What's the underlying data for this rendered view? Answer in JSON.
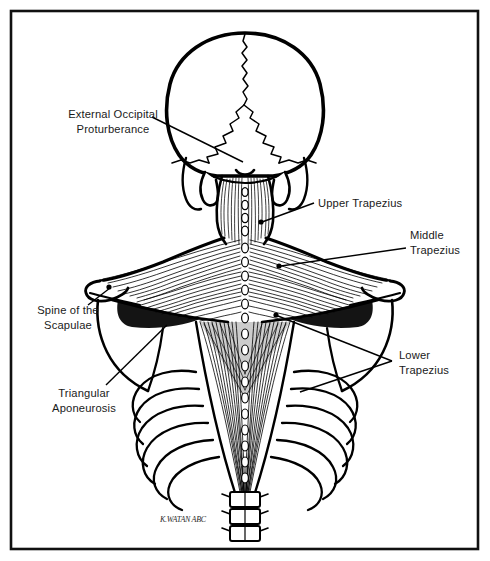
{
  "figure": {
    "background_color": "#ffffff",
    "ink_color": "#000000",
    "border": {
      "present": true,
      "color": "#111111",
      "inset_px": 10,
      "stroke_px": 2.5
    },
    "width_px": 490,
    "height_px": 561
  },
  "annotations": [
    {
      "id": "external-occipital-protuberance",
      "lines": [
        "External Occipital",
        "Proturberance"
      ],
      "line1": "External Occipital",
      "line2": "Proturberance",
      "align": "middle",
      "text_x": 113,
      "text_y1": 118,
      "text_y2": 133,
      "leader": {
        "x1": 152,
        "y1": 117,
        "x2": 243,
        "y2": 162
      },
      "marker": null
    },
    {
      "id": "upper-trapezius",
      "lines": [
        "Upper Trapezius"
      ],
      "line1": "Upper Trapezius",
      "line2": "",
      "align": "start",
      "text_x": 318,
      "text_y1": 207,
      "text_y2": 0,
      "leader": {
        "x1": 314,
        "y1": 203,
        "x2": 262,
        "y2": 222
      },
      "marker": {
        "x": 261,
        "y": 222,
        "r": 2.6
      }
    },
    {
      "id": "middle-trapezius",
      "lines": [
        "Middle",
        "Trapezius"
      ],
      "line1": "Middle",
      "line2": "Trapezius",
      "align": "start",
      "text_x": 410,
      "text_y1": 239,
      "text_y2": 254,
      "leader": {
        "x1": 406,
        "y1": 248,
        "x2": 281,
        "y2": 266
      },
      "marker": {
        "x": 279,
        "y": 266,
        "r": 2.6
      }
    },
    {
      "id": "spine-of-the-scapulae",
      "lines": [
        "Spine of the",
        "Scapulae"
      ],
      "line1": "Spine of the",
      "line2": "Scapulae",
      "align": "middle",
      "text_x": 68,
      "text_y1": 314,
      "text_y2": 329,
      "leader": {
        "x1": 88,
        "y1": 305,
        "x2": 110,
        "y2": 288
      },
      "marker": {
        "x": 109,
        "y": 287,
        "r": 2.6
      }
    },
    {
      "id": "triangular-aponeurosis",
      "lines": [
        "Triangular",
        "Aponeurosis"
      ],
      "line1": "Triangular",
      "line2": "Aponeurosis",
      "align": "middle",
      "text_x": 84,
      "text_y1": 397,
      "text_y2": 412,
      "leader": {
        "x1": 106,
        "y1": 385,
        "x2": 167,
        "y2": 325
      },
      "marker": null
    },
    {
      "id": "lower-trapezius",
      "lines": [
        "Lower",
        "Trapezius"
      ],
      "line1": "Lower",
      "line2": "Trapezius",
      "align": "start",
      "text_x": 399,
      "text_y1": 359,
      "text_y2": 374,
      "leader": {
        "x1": 392,
        "y1": 361,
        "x2": 278,
        "y2": 316
      },
      "leader2": {
        "x1": 392,
        "y1": 361,
        "x2": 300,
        "y2": 392
      },
      "marker": {
        "x": 276,
        "y": 315,
        "r": 2.6
      }
    }
  ],
  "signature": {
    "text": "K.WATAN ABC",
    "x": 160,
    "y": 522
  },
  "anatomy": {
    "structures": [
      "occipital bone of the skull",
      "sagittal suture",
      "lambdoid suture",
      "mastoid processes",
      "cervical spinous processes",
      "upper trapezius fibers",
      "middle trapezius fibers",
      "lower trapezius fibers",
      "triangular aponeurosis",
      "spine of the scapula",
      "acromion process",
      "rib cage",
      "thoracic vertebrae"
    ],
    "view": "posterior",
    "style": "black-and-white pen-and-ink line drawing with hatched muscle striations"
  }
}
